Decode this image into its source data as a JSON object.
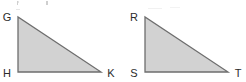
{
  "figure": {
    "background_color": "#ffffff",
    "fill_color": "#d2d2d2",
    "stroke_color": "#6e6e6e",
    "label_color": "#2b2b2b",
    "shapes": [
      {
        "name": "triangle-ghk",
        "label": "Triangle GHK",
        "type": "right-triangle",
        "vertices": [
          {
            "label": "G",
            "role": "apex",
            "x": 18,
            "y": 17,
            "label_x": 7,
            "label_y": 17
          },
          {
            "label": "H",
            "role": "right-angle",
            "x": 18,
            "y": 72,
            "label_x": 7,
            "label_y": 76
          },
          {
            "label": "K",
            "role": "base-right",
            "x": 101,
            "y": 72,
            "label_x": 108,
            "label_y": 76
          }
        ],
        "points_path": "18,17 18,72 101,72"
      },
      {
        "name": "triangle-rst",
        "label": "Triangle RST",
        "type": "right-triangle",
        "vertices": [
          {
            "label": "R",
            "role": "apex",
            "x": 145,
            "y": 17,
            "label_x": 134,
            "label_y": 17
          },
          {
            "label": "S",
            "role": "right-angle",
            "x": 145,
            "y": 72,
            "label_x": 134,
            "label_y": 76
          },
          {
            "label": "T",
            "role": "base-right",
            "x": 228,
            "y": 72,
            "label_x": 235,
            "label_y": 76
          }
        ],
        "points_path": "145,17 145,72 228,72"
      }
    ]
  }
}
